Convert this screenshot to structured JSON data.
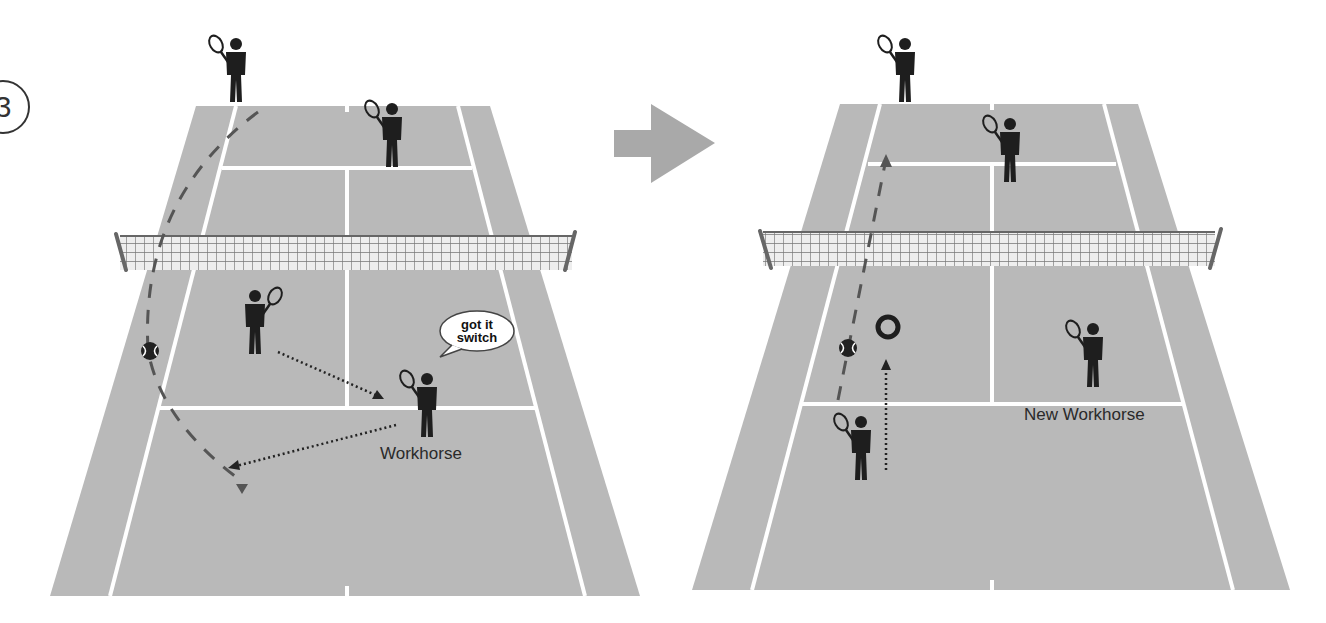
{
  "diagram": {
    "step_number": "3",
    "colors": {
      "court": "#b9b9b9",
      "lines": "#ffffff",
      "player": "#1e1e1e",
      "arrow_gray": "#a9a9a9",
      "ball_path": "#555555",
      "net_post": "#666666"
    },
    "panels": [
      {
        "id": "before",
        "speech_bubble": {
          "line1": "got it",
          "line2": "switch"
        },
        "label": "Workhorse",
        "players": 4,
        "ball": "tennis-ball on left alley"
      },
      {
        "id": "after",
        "label": "New Workhorse",
        "players": 4,
        "ball": "tennis-ball near target ring"
      }
    ],
    "transition_arrow": "right-arrow"
  }
}
